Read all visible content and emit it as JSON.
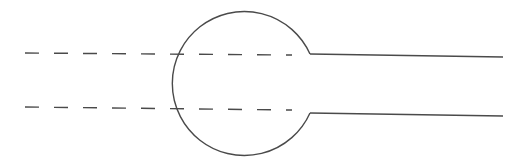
{
  "diagram": {
    "colors": {
      "stroke": "#4a4a4a",
      "background": "#ffffff"
    },
    "circle": {
      "cx": 245,
      "cy": 83,
      "r": 72,
      "opening_top": {
        "x": 310,
        "y": 54
      },
      "opening_bottom": {
        "x": 310,
        "y": 113
      }
    },
    "dashed_lines": [
      {
        "x1": 25,
        "y1": 53,
        "x2": 292,
        "y2": 55
      },
      {
        "x1": 25,
        "y1": 107,
        "x2": 292,
        "y2": 110
      }
    ],
    "solid_lines": [
      {
        "x1": 310,
        "y1": 54,
        "x2": 503,
        "y2": 57
      },
      {
        "x1": 310,
        "y1": 113,
        "x2": 503,
        "y2": 116
      }
    ]
  }
}
